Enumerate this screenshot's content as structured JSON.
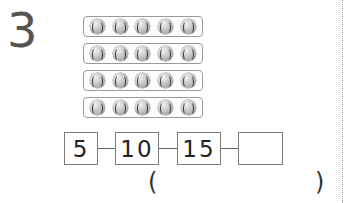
{
  "question": {
    "number": "3",
    "ball_icon": "baseball-icon",
    "rows": [
      {
        "count": 5
      },
      {
        "count": 5
      },
      {
        "count": 5
      },
      {
        "count": 5
      }
    ],
    "sequence": [
      "5",
      "10",
      "15",
      ""
    ],
    "answer_open": "(",
    "answer_close": ")",
    "answer_value": ""
  }
}
